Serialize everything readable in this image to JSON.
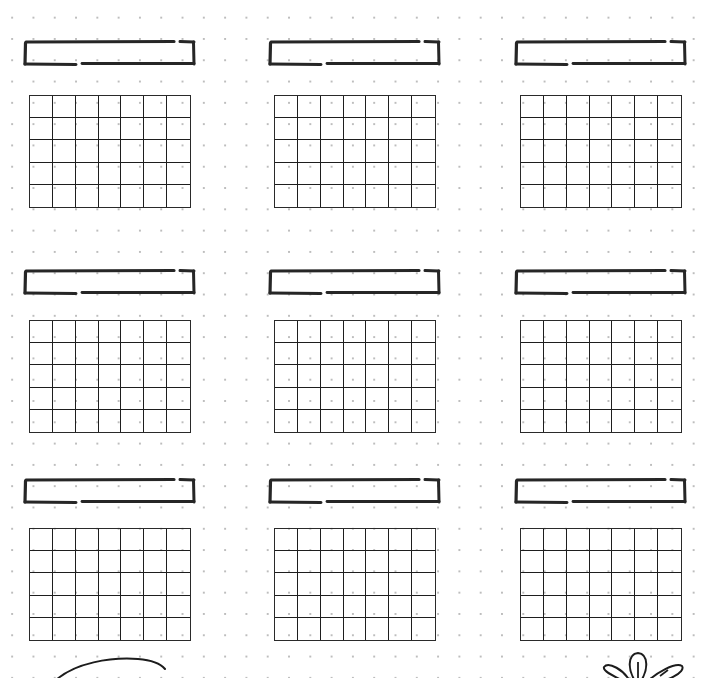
{
  "page": {
    "type": "dot-grid planner page",
    "background": "#ffffff",
    "dot_color": "#bdbdbd",
    "ink_color": "#222222"
  },
  "layout": {
    "columns_x": [
      24,
      269,
      515
    ],
    "label_y": [
      40,
      269,
      478
    ],
    "grid_y": [
      95,
      320,
      528
    ],
    "grid_offset_x": 5,
    "grid_columns": 7,
    "grid_rows": 5
  },
  "calendars": [
    {
      "id": "month-1",
      "title": ""
    },
    {
      "id": "month-2",
      "title": ""
    },
    {
      "id": "month-3",
      "title": ""
    },
    {
      "id": "month-4",
      "title": ""
    },
    {
      "id": "month-5",
      "title": ""
    },
    {
      "id": "month-6",
      "title": ""
    },
    {
      "id": "month-7",
      "title": ""
    },
    {
      "id": "month-8",
      "title": ""
    },
    {
      "id": "month-9",
      "title": ""
    }
  ],
  "decorations": [
    {
      "name": "swoosh-curve",
      "position": "bottom-left"
    },
    {
      "name": "leaf-flower",
      "position": "bottom-right"
    }
  ]
}
